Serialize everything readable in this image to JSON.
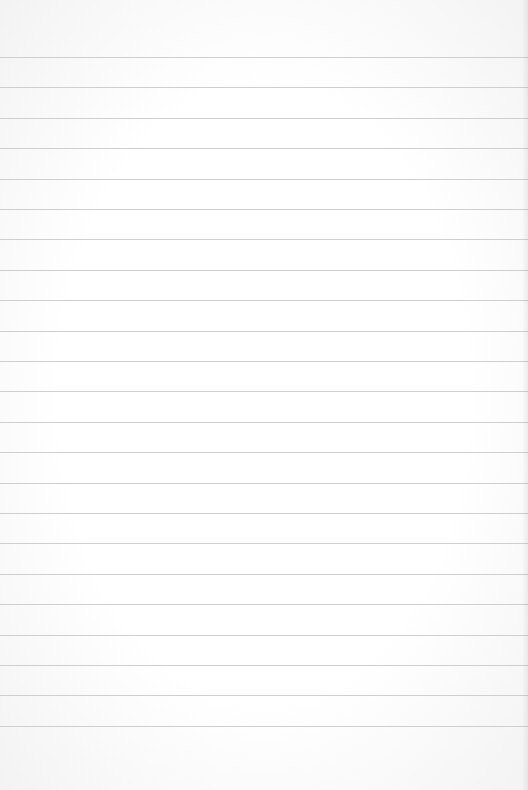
{
  "page": {
    "type": "lined-paper",
    "background_color": "#fafafa",
    "rule_color": "#cfcfcf",
    "rule_count": 23,
    "first_rule_y": 57,
    "rule_spacing": 30.4
  }
}
